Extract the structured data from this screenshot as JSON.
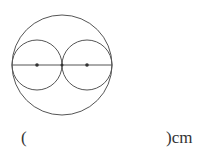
{
  "figure": {
    "stroke_color": "#555555",
    "large_circle": {
      "cx": 62,
      "cy": 65,
      "r": 50
    },
    "small_circles": [
      {
        "cx": 37,
        "cy": 65,
        "r": 25
      },
      {
        "cx": 87,
        "cy": 65,
        "r": 25
      }
    ],
    "diameter_line": {
      "x1": 12,
      "y1": 65,
      "x2": 112,
      "y2": 65
    },
    "center_points": [
      {
        "x": 37,
        "y": 65
      },
      {
        "x": 87,
        "y": 65
      }
    ]
  },
  "answer": {
    "open_paren": "(",
    "blank": "",
    "close_paren": ")",
    "unit": "cm"
  }
}
